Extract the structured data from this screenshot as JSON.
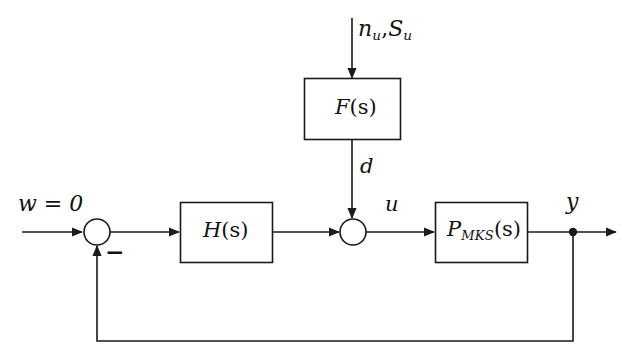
{
  "diagram": {
    "stroke_color": "#1a1a1a",
    "background_color": "#ffffff",
    "blocks": [
      {
        "id": "filter",
        "label_main": "F",
        "label_sub": "",
        "label_arg": "(s)"
      },
      {
        "id": "controller",
        "label_main": "H",
        "label_sub": "",
        "label_arg": "(s)"
      },
      {
        "id": "plant",
        "label_main": "P",
        "label_sub": "MKS",
        "label_arg": "(s)"
      }
    ],
    "labels": {
      "noise_n": "n",
      "noise_n_sub": "u",
      "noise_comma": ",",
      "noise_S": "S",
      "noise_S_sub": "u",
      "disturbance": "d",
      "reference": "w = 0",
      "sum_sign": "−",
      "control": "u",
      "output": "y",
      "filter_main": "F",
      "filter_arg": "(s)",
      "controller_main": "H",
      "controller_arg": "(s)",
      "plant_main": "P",
      "plant_sub": "MKS",
      "plant_arg": "(s)"
    },
    "nodes": {
      "sum_left": {
        "cx": 97,
        "cy": 232,
        "r": 13
      },
      "sum_mid": {
        "cx": 353,
        "cy": 232,
        "r": 13
      },
      "tap_y": {
        "cx": 573,
        "cy": 232,
        "r": 4
      }
    }
  }
}
